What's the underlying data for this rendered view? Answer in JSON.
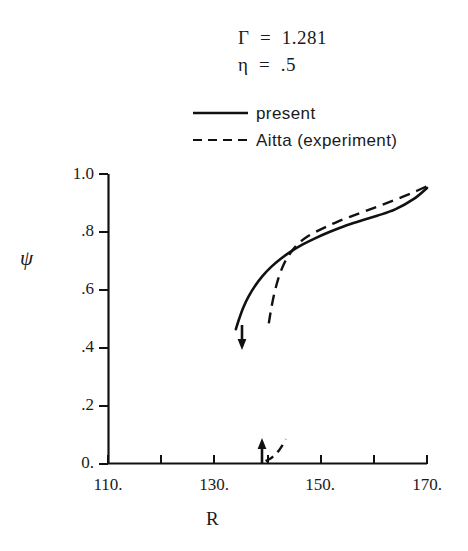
{
  "annotations": {
    "gamma": "Γ  =  1.281",
    "eta": "η  =  .5"
  },
  "legend": {
    "position": "top-center",
    "entries": [
      {
        "label": "present",
        "style": "solid"
      },
      {
        "label": "Aitta (experiment)",
        "style": "dashed"
      }
    ]
  },
  "axes": {
    "xlabel": "R",
    "ylabel": "ψ",
    "xlim": [
      110,
      170
    ],
    "ylim": [
      0,
      1.0
    ],
    "xticks": [
      110,
      120,
      130,
      140,
      150,
      160,
      170
    ],
    "xtick_labels": [
      "110.",
      "",
      "130.",
      "",
      "150.",
      "",
      "170."
    ],
    "yticks": [
      0,
      0.2,
      0.4,
      0.6,
      0.8,
      1.0
    ],
    "ytick_labels": [
      "0.",
      ".2",
      ".4",
      ".6",
      ".8",
      "1.0"
    ],
    "grid": false
  },
  "chart_data": {
    "type": "line",
    "title": "",
    "subtitle": "",
    "xlabel": "R",
    "ylabel": "ψ",
    "xlim": [
      110,
      170
    ],
    "ylim": [
      0,
      1.0
    ],
    "grid": false,
    "legend_position": "top-center",
    "annotations": [
      {
        "text": "Γ  =  1.281",
        "x": 150,
        "y": 1.47
      },
      {
        "text": "η  =  .5",
        "x": 150,
        "y": 1.38
      },
      {
        "type": "arrow-down",
        "x": 135.3,
        "y_from": 0.48,
        "y_to": 0.4
      },
      {
        "type": "arrow-up",
        "x": 139.0,
        "y_from": 0.0,
        "y_to": 0.1
      }
    ],
    "series": [
      {
        "name": "present",
        "style": "solid",
        "x": [
          134.0,
          134.6,
          135.4,
          136.4,
          137.6,
          139.0,
          140.6,
          142.4,
          144.4,
          146.6,
          149.0,
          151.6,
          154.4,
          157.4,
          160.6,
          164.0,
          167.6,
          170.0
        ],
        "y": [
          0.465,
          0.5,
          0.54,
          0.578,
          0.614,
          0.648,
          0.679,
          0.707,
          0.733,
          0.757,
          0.779,
          0.8,
          0.82,
          0.838,
          0.856,
          0.878,
          0.915,
          0.952
        ]
      },
      {
        "name": "Aitta (experiment)",
        "style": "dashed",
        "x": [
          140.2,
          140.6,
          141.2,
          142.0,
          143.0,
          144.2,
          145.6,
          147.2,
          149.0,
          151.0,
          153.2,
          155.6,
          158.2,
          161.0,
          164.0,
          167.2,
          170.0
        ],
        "y": [
          0.485,
          0.53,
          0.585,
          0.64,
          0.688,
          0.726,
          0.757,
          0.781,
          0.8,
          0.818,
          0.836,
          0.853,
          0.871,
          0.89,
          0.911,
          0.935,
          0.958
        ]
      },
      {
        "name": "Aitta (experiment) lower branch",
        "style": "dashed",
        "x": [
          139.6,
          140.6,
          141.6,
          142.6,
          143.4
        ],
        "y": [
          0.01,
          0.02,
          0.035,
          0.06,
          0.086
        ]
      }
    ]
  }
}
